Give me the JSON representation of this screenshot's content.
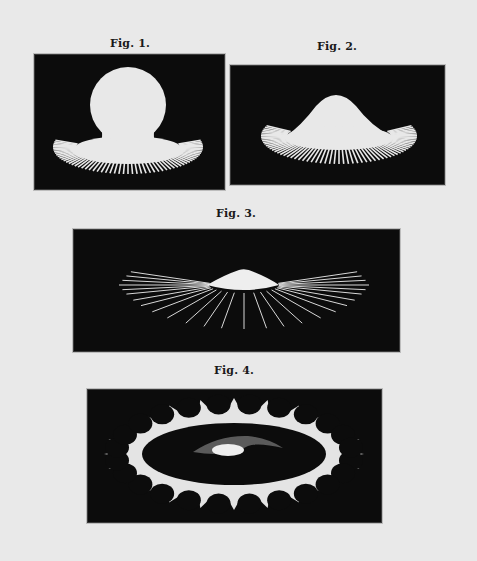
{
  "page": {
    "background": "#e9e9e9",
    "figures": [
      {
        "id": "fig1",
        "caption": "Fig. 1.",
        "subject": "spherical body with radiating rays at base"
      },
      {
        "id": "fig2",
        "caption": "Fig. 2.",
        "subject": "mound-shaped body with radiating rays at base"
      },
      {
        "id": "fig3",
        "caption": "Fig. 3.",
        "subject": "low cap shape with long radiating lines"
      },
      {
        "id": "fig4",
        "caption": "Fig. 4.",
        "subject": "elliptical ring with scalloped spikes and central glow"
      }
    ]
  }
}
